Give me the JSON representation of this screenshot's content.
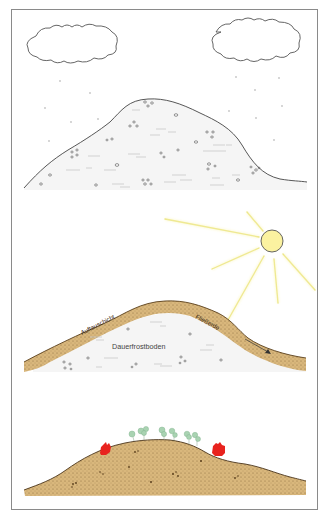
{
  "colors": {
    "frame": "#8a8a8a",
    "outline": "#444444",
    "snow_fill": "#f4f4f4",
    "soil": "#d9b77c",
    "soil_dark": "#6b4a22",
    "sun_fill": "#fbf2a0",
    "sun_ray": "#e4dc6a",
    "tree": "#a9d3b2",
    "house": "#e8231e",
    "text": "#3a3a3a"
  },
  "panels": [
    {
      "name": "winter",
      "elements": [
        "clouds",
        "snowfall",
        "snow-covered-hill"
      ]
    },
    {
      "name": "thaw",
      "elements": [
        "sun",
        "active-layer",
        "permafrost"
      ]
    },
    {
      "name": "today",
      "elements": [
        "trees",
        "houses",
        "soil-hill"
      ]
    }
  ],
  "labels": {
    "active_layer": "Auftauschicht",
    "solifluction": "Fließerde",
    "permafrost": "Dauerfrostboden"
  },
  "icons": [
    "cloud-icon",
    "sun-icon",
    "tree-icon",
    "house-icon",
    "arrow-icon"
  ]
}
